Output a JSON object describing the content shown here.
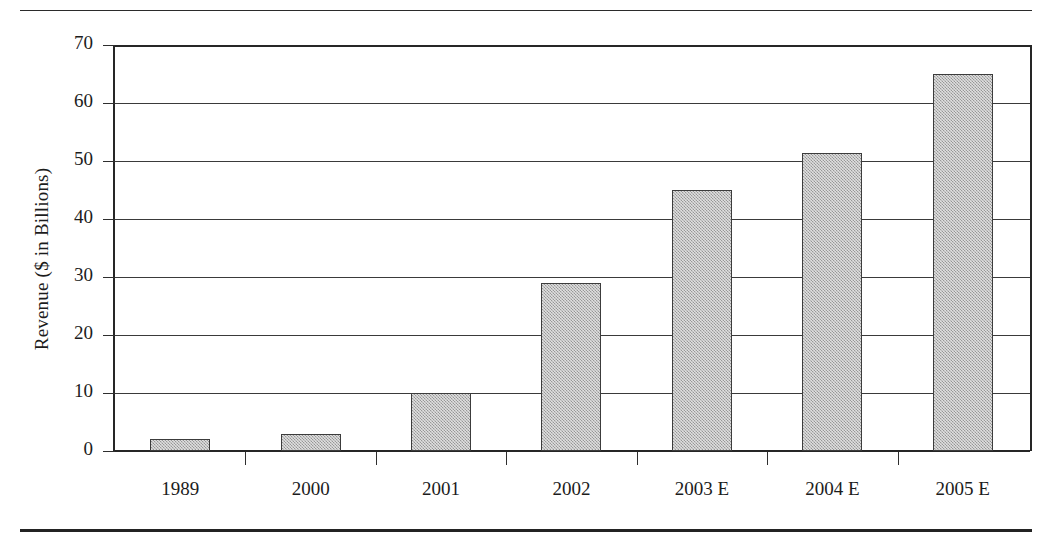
{
  "chart_data": {
    "type": "bar",
    "title": "",
    "xlabel": "",
    "ylabel": "Revenue ($ in Billions)",
    "categories": [
      "1989",
      "2000",
      "2001",
      "2002",
      "2003 E",
      "2004 E",
      "2005 E"
    ],
    "values": [
      2,
      3,
      10,
      29,
      45,
      51.3,
      65
    ],
    "ylim": [
      0,
      70
    ],
    "ytick_labels": [
      "0",
      "10",
      "20",
      "30",
      "40",
      "50",
      "60",
      "70"
    ],
    "ytick_values": [
      0,
      10,
      20,
      30,
      40,
      50,
      60,
      70
    ],
    "grid": true,
    "legend": "none",
    "bar_fill_color": "#b9b9b9",
    "bar_border_color": "#3c3c3c",
    "axis_color": "#262626",
    "background_color": "#ffffff"
  },
  "figure": {
    "top_rule": "",
    "bottom_rule": ""
  }
}
